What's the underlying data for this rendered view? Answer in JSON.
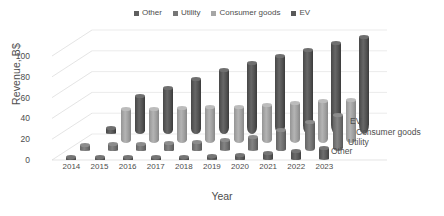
{
  "chart_data": {
    "type": "bar",
    "subtype": "3d-grouped-cylinder",
    "title": "",
    "xlabel": "Year",
    "ylabel": "Revenue, B$",
    "ylim": [
      0,
      100
    ],
    "yticks": [
      0,
      20,
      40,
      60,
      80,
      100
    ],
    "grid": true,
    "legend_position": "top",
    "categories": [
      "2014",
      "2015",
      "2016",
      "2017",
      "2018",
      "2019",
      "2020",
      "2021",
      "2022",
      "2023"
    ],
    "depth_axis_labels": [
      "Other",
      "Utility",
      "Consumer goods",
      "EV"
    ],
    "series": [
      {
        "name": "Other",
        "color": "#5f5f5f",
        "values": [
          5,
          5,
          5,
          5,
          5,
          6,
          7,
          9,
          11,
          13
        ]
      },
      {
        "name": "Utility",
        "color": "#767676",
        "values": [
          8,
          9,
          9,
          10,
          11,
          13,
          16,
          22,
          30,
          37
        ]
      },
      {
        "name": "Consumer goods",
        "color": "#a6a6a6",
        "values": [
          0,
          34,
          34,
          35,
          36,
          36,
          38,
          40,
          42,
          43
        ]
      },
      {
        "name": "EV",
        "color": "#595959",
        "values": [
          8,
          38,
          46,
          55,
          63,
          70,
          77,
          83,
          89,
          95
        ]
      }
    ]
  },
  "legend": {
    "items": [
      {
        "label": "Other",
        "color": "#5f5f5f"
      },
      {
        "label": "Utility",
        "color": "#767676"
      },
      {
        "label": "Consumer goods",
        "color": "#a6a6a6"
      },
      {
        "label": "EV",
        "color": "#595959"
      }
    ]
  }
}
